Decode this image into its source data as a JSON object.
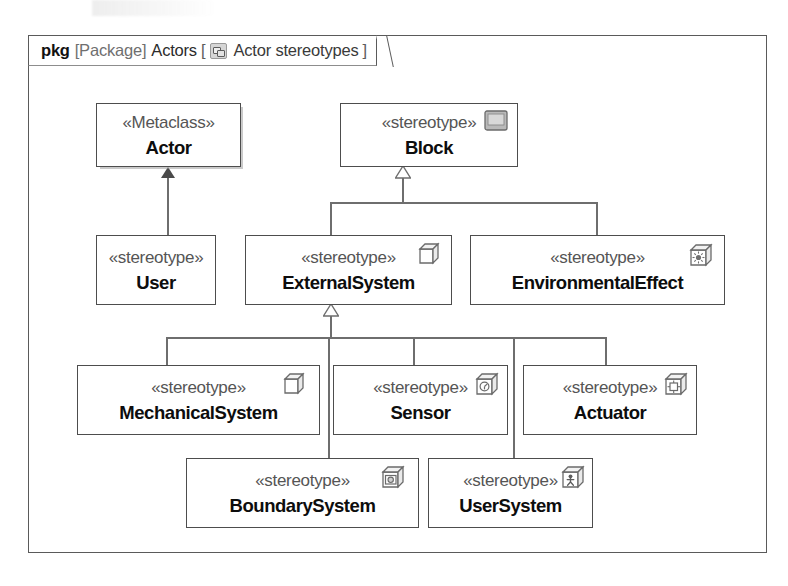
{
  "diagram": {
    "kind": "sysml-profile-package-diagram",
    "frame": {
      "keyword": "pkg",
      "metatype": "[Package]",
      "name": "Actors",
      "bracket_open": "[",
      "bracket_close": "]",
      "view_icon": "stereotype-package-icon",
      "view_name": "Actor stereotypes"
    },
    "nodes": [
      {
        "id": "actor",
        "keyword": "«Metaclass»",
        "name": "Actor",
        "icon": "none",
        "shadow": true,
        "x": 96,
        "y": 103,
        "w": 145,
        "h": 64
      },
      {
        "id": "block",
        "keyword": "«stereotype»",
        "name": "Block",
        "icon": "block-icon",
        "shadow": false,
        "x": 340,
        "y": 103,
        "w": 178,
        "h": 64
      },
      {
        "id": "user",
        "keyword": "«stereotype»",
        "name": "User",
        "icon": "none",
        "shadow": false,
        "x": 96,
        "y": 235,
        "w": 120,
        "h": 70
      },
      {
        "id": "externalsystem",
        "keyword": "«stereotype»",
        "name": "ExternalSystem",
        "icon": "cube-icon",
        "shadow": false,
        "x": 245,
        "y": 235,
        "w": 207,
        "h": 70
      },
      {
        "id": "environmentaleffect",
        "keyword": "«stereotype»",
        "name": "EnvironmentalEffect",
        "icon": "environment-cube-icon",
        "shadow": false,
        "x": 470,
        "y": 235,
        "w": 255,
        "h": 70
      },
      {
        "id": "mechanicalsystem",
        "keyword": "«stereotype»",
        "name": "MechanicalSystem",
        "icon": "cube-icon",
        "shadow": false,
        "x": 77,
        "y": 365,
        "w": 243,
        "h": 70
      },
      {
        "id": "sensor",
        "keyword": "«stereotype»",
        "name": "Sensor",
        "icon": "sensor-cube-icon",
        "shadow": false,
        "x": 333,
        "y": 365,
        "w": 175,
        "h": 70
      },
      {
        "id": "actuator",
        "keyword": "«stereotype»",
        "name": "Actuator",
        "icon": "actuator-cube-icon",
        "shadow": false,
        "x": 523,
        "y": 365,
        "w": 174,
        "h": 70
      },
      {
        "id": "boundarysystem",
        "keyword": "«stereotype»",
        "name": "BoundarySystem",
        "icon": "camera-cube-icon",
        "shadow": false,
        "x": 186,
        "y": 458,
        "w": 233,
        "h": 70
      },
      {
        "id": "usersystem",
        "keyword": "«stereotype»",
        "name": "UserSystem",
        "icon": "user-cube-icon",
        "shadow": false,
        "x": 428,
        "y": 458,
        "w": 165,
        "h": 70
      }
    ],
    "relationships": [
      {
        "from": "user",
        "to": "actor",
        "type": "extension",
        "arrow": "filled-triangle"
      },
      {
        "from": "externalsystem",
        "to": "block",
        "type": "generalization",
        "arrow": "hollow-triangle"
      },
      {
        "from": "environmentaleffect",
        "to": "block",
        "type": "generalization",
        "arrow": "hollow-triangle"
      },
      {
        "from": "mechanicalsystem",
        "to": "externalsystem",
        "type": "generalization",
        "arrow": "hollow-triangle"
      },
      {
        "from": "sensor",
        "to": "externalsystem",
        "type": "generalization",
        "arrow": "hollow-triangle"
      },
      {
        "from": "actuator",
        "to": "externalsystem",
        "type": "generalization",
        "arrow": "hollow-triangle"
      },
      {
        "from": "boundarysystem",
        "to": "externalsystem",
        "type": "generalization",
        "arrow": "hollow-triangle"
      },
      {
        "from": "usersystem",
        "to": "externalsystem",
        "type": "generalization",
        "arrow": "hollow-triangle"
      }
    ],
    "colors": {
      "frame_border": "#5a5a5a",
      "node_border": "#4d4d4d",
      "edge": "#6e6e6e",
      "keyword_text": "#555555",
      "name_text": "#0d0d0d",
      "background": "#ffffff"
    }
  }
}
